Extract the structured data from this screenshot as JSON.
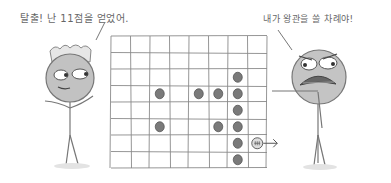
{
  "captions": {
    "left_character": "탈출! 난 11점을 얻었어.",
    "right_character": "내가 왕관을 쓸 차례야!"
  },
  "board": {
    "columns": 8,
    "rows": 8,
    "left": 111,
    "top": 36,
    "cell_w": 19.5,
    "cell_h": 16.5,
    "dots": [
      {
        "col": 6,
        "row": 2
      },
      {
        "col": 2,
        "row": 3
      },
      {
        "col": 4,
        "row": 3
      },
      {
        "col": 5,
        "row": 3
      },
      {
        "col": 6,
        "row": 3
      },
      {
        "col": 6,
        "row": 4
      },
      {
        "col": 2,
        "row": 5
      },
      {
        "col": 5,
        "row": 5
      },
      {
        "col": 6,
        "row": 5
      },
      {
        "col": 6,
        "row": 6
      },
      {
        "col": 6,
        "row": 7
      }
    ],
    "snake_head": {
      "col": 7,
      "row": 6,
      "direction": "right"
    }
  },
  "colors": {
    "line": "#8a8a8a",
    "dot": "#7a7a7a",
    "face": "#bdbdbd",
    "background": "#ffffff"
  }
}
